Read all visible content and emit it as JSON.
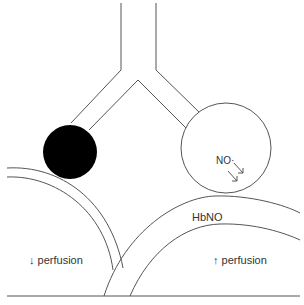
{
  "diagram": {
    "labels": {
      "no_radical": "NO·",
      "hbno": "HbNO",
      "left_perfusion": "↓ perfusion",
      "right_perfusion": "↑ perfusion"
    },
    "colors": {
      "stroke": "#555555",
      "occluded_vessel_fill": "#000000",
      "open_vessel_fill": "#ffffff",
      "text": "#333333"
    }
  }
}
